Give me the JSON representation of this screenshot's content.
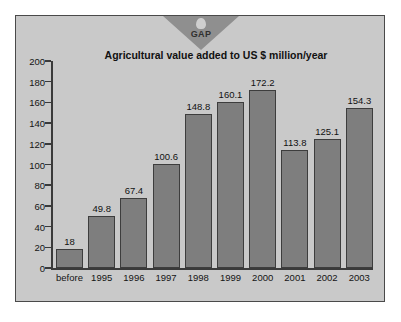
{
  "logo": {
    "name": "GAP",
    "label": "GAP"
  },
  "chart_data": {
    "type": "bar",
    "title": "Agricultural value added to US $ million/year",
    "xlabel": "",
    "ylabel": "",
    "ylim": [
      0,
      200
    ],
    "ytick_step": 20,
    "yticks": [
      200,
      180,
      160,
      140,
      120,
      100,
      80,
      60,
      40,
      20,
      0
    ],
    "grid": false,
    "legend": null,
    "bar_color": "#7e7e7e",
    "bar_edge_color": "#3d3d3d",
    "background_color": "#c9c9c9",
    "categories": [
      "before",
      "1995",
      "1996",
      "1997",
      "1998",
      "1999",
      "2000",
      "2001",
      "2002",
      "2003"
    ],
    "values": [
      18,
      49.8,
      67.4,
      100.6,
      148.8,
      160.1,
      172.2,
      113.8,
      125.1,
      154.3
    ],
    "value_labels": [
      "18",
      "49.8",
      "67.4",
      "100.6",
      "148.8",
      "160.1",
      "172.2",
      "113.8",
      "125.1",
      "154.3"
    ]
  }
}
